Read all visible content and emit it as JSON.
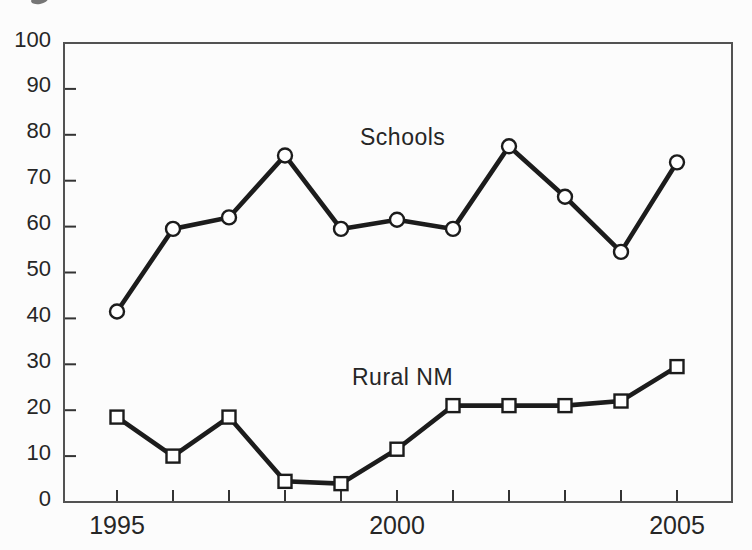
{
  "figure": {
    "background": "#fcfcfc",
    "ink_color": "#1c1c1c",
    "frame_color": "#525252",
    "tick_color": "#333333",
    "text_color": "#262626"
  },
  "chart_data": {
    "type": "line",
    "x": [
      1995,
      1996,
      1997,
      1998,
      1999,
      2000,
      2001,
      2002,
      2003,
      2004,
      2005
    ],
    "series": [
      {
        "name": "Schools",
        "marker": "circle",
        "values": [
          41.5,
          59.5,
          62,
          75.5,
          59.5,
          61.5,
          59.5,
          77.5,
          66.5,
          54.5,
          74
        ]
      },
      {
        "name": "Rural NM",
        "marker": "square",
        "values": [
          18.5,
          10,
          18.5,
          4.5,
          4,
          11.5,
          21,
          21,
          21,
          22,
          29.5
        ]
      }
    ],
    "title": "",
    "xlabel": "",
    "ylabel": "",
    "ylim": [
      0,
      100
    ],
    "y_tick_step": 10,
    "y_tick_labels": [
      "0",
      "10",
      "20",
      "30",
      "40",
      "50",
      "60",
      "70",
      "80",
      "90",
      "100"
    ],
    "x_labeled_ticks": [
      1995,
      2000,
      2005
    ],
    "x_tick_labels": [
      "1995",
      "2000",
      "2005"
    ],
    "grid": false,
    "legend_position": "inline-labels"
  }
}
